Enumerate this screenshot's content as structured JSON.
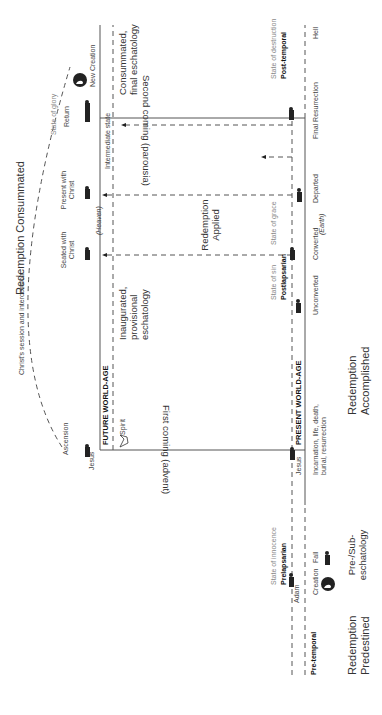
{
  "title": "Redemption Consummated",
  "headings": {
    "predestined": "Redemption Predestined",
    "accomplished": "Redemption Accomplished",
    "applied": "Redemption Applied",
    "consummated": "Redemption Consummated",
    "pre_sub": "Pre-/Sub-eschatology"
  },
  "ages": {
    "future": "FUTURE WORLD-AGE",
    "present": "PRESENT WORLD-AGE"
  },
  "eschatology": {
    "inaugurated": "Inaugurated, provisional eschatology",
    "consummated": "Consummated, final eschatology",
    "intermediate": "Intermediate state"
  },
  "comings": {
    "first": "First coming (advent)",
    "second": "Second coming (parousia)"
  },
  "spirit": "Spirit",
  "session": "Christ's session and intercession",
  "heaven_label": "(Heaven)",
  "earth_label": "(Earth)",
  "top_row": {
    "jesus": "Jesus",
    "ascension": "Ascension",
    "seated": "Seated with Christ",
    "present": "Present with Christ",
    "state_of_glory": "State of glory",
    "return": "Return",
    "new_creation": "New Creation"
  },
  "bottom_row": {
    "pre_temporal": "Pre-temporal",
    "adam": "Adam",
    "creation": "Creation",
    "state_of_innocence": "State of innocence",
    "prelapsarian": "Prelapsarian",
    "fall": "Fall",
    "jesus": "Jesus",
    "incarnation": "Incarnation, life, death, burial, resurrection",
    "state_of_sin": "State of sin",
    "postlapsarian": "Postlapsarian",
    "unconverted": "Unconverted",
    "converted": "Converted",
    "state_of_grace": "State of grace",
    "departed": "Departed",
    "final_resurrection": "Final Resurrection",
    "state_of_destruction": "State of destruction",
    "post_temporal": "Post-temporal",
    "hell": "Hell"
  }
}
